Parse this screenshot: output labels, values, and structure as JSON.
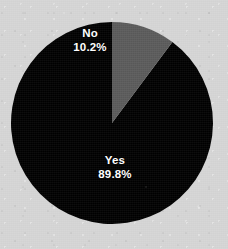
{
  "chart_data": {
    "type": "pie",
    "title": "",
    "subtitle": "",
    "xlabel": "",
    "ylabel": "",
    "legend": "none",
    "grid": false,
    "labels_inside_slices": true,
    "start_angle_deg": 0,
    "direction": "counterclockwise",
    "categories": [
      "Yes",
      "No"
    ],
    "values": [
      89.8,
      10.2
    ],
    "unit": "%",
    "slices": [
      {
        "name": "Yes",
        "label": "Yes",
        "value": 89.8,
        "value_label": "89.8%",
        "color": "#000000",
        "text_color": "#ffffff"
      },
      {
        "name": "No",
        "label": "No",
        "value": 10.2,
        "value_label": "10.2%",
        "color": "#5a5a5a",
        "text_color": "#ffffff"
      }
    ]
  },
  "figure": {
    "background_color": "#d5d5d5",
    "pie_center_x": 112,
    "pie_center_y": 123,
    "pie_radius": 101
  }
}
